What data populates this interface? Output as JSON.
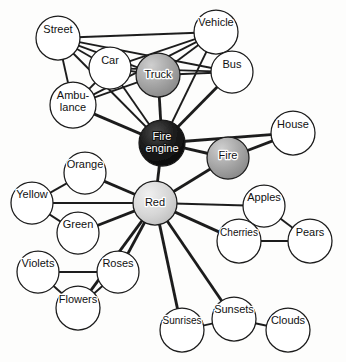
{
  "figure": {
    "caption": "",
    "width": 346,
    "height": 362,
    "background": "#fdfdfc"
  },
  "style": {
    "node_outline": "#1a1a1a",
    "link_color": "#1f1f1f",
    "label_color": "#111111",
    "label_color_on_dark": "#ffffff",
    "fill_empty": "#ffffff",
    "fill_light": "#d8d8d8",
    "fill_medium": "#9a9a9a",
    "fill_dark": "#141414"
  },
  "nodes": [
    {
      "id": "street",
      "label": "Street",
      "x": 58,
      "y": 38,
      "r": 22,
      "activation": "none",
      "label_dx": 0,
      "label_dy": -8,
      "lines": [
        "Street"
      ]
    },
    {
      "id": "vehicle",
      "label": "Vehicle",
      "x": 216,
      "y": 32,
      "r": 22,
      "activation": "none",
      "label_dx": 0,
      "label_dy": -9,
      "lines": [
        "Vehicle"
      ]
    },
    {
      "id": "car",
      "label": "Car",
      "x": 110,
      "y": 68,
      "r": 21,
      "activation": "none",
      "label_dx": 0,
      "label_dy": -7,
      "lines": [
        "Car"
      ]
    },
    {
      "id": "truck",
      "label": "Truck",
      "x": 158,
      "y": 75,
      "r": 22,
      "activation": "medium",
      "label_dx": 0,
      "label_dy": 0,
      "lines": [
        "Truck"
      ]
    },
    {
      "id": "bus",
      "label": "Bus",
      "x": 232,
      "y": 72,
      "r": 21,
      "activation": "none",
      "label_dx": 0,
      "label_dy": -7,
      "lines": [
        "Bus"
      ]
    },
    {
      "id": "ambulance",
      "label": "Ambulance",
      "x": 73,
      "y": 105,
      "r": 23,
      "activation": "none",
      "label_dx": 0,
      "label_dy": -3,
      "lines": [
        "Ambu-",
        "lance"
      ]
    },
    {
      "id": "fireengine",
      "label": "Fire engine",
      "x": 162,
      "y": 143,
      "r": 23,
      "activation": "dark",
      "label_dx": 0,
      "label_dy": 0,
      "lines": [
        "Fire",
        "engine"
      ]
    },
    {
      "id": "fire",
      "label": "Fire",
      "x": 228,
      "y": 158,
      "r": 21,
      "activation": "medium",
      "label_dx": 0,
      "label_dy": -2,
      "lines": [
        "Fire"
      ]
    },
    {
      "id": "house",
      "label": "House",
      "x": 293,
      "y": 133,
      "r": 22,
      "activation": "none",
      "label_dx": 0,
      "label_dy": -8,
      "lines": [
        "House"
      ]
    },
    {
      "id": "orange",
      "label": "Orange",
      "x": 85,
      "y": 173,
      "r": 21,
      "activation": "none",
      "label_dx": 0,
      "label_dy": -8,
      "lines": [
        "Orange"
      ]
    },
    {
      "id": "red",
      "label": "Red",
      "x": 155,
      "y": 203,
      "r": 22,
      "activation": "light",
      "label_dx": 0,
      "label_dy": 0,
      "lines": [
        "Red"
      ]
    },
    {
      "id": "yellow",
      "label": "Yellow",
      "x": 32,
      "y": 203,
      "r": 21,
      "activation": "none",
      "label_dx": 0,
      "label_dy": -8,
      "lines": [
        "Yellow"
      ]
    },
    {
      "id": "green",
      "label": "Green",
      "x": 78,
      "y": 233,
      "r": 21,
      "activation": "none",
      "label_dx": 0,
      "label_dy": -8,
      "lines": [
        "Green"
      ]
    },
    {
      "id": "apples",
      "label": "Apples",
      "x": 264,
      "y": 206,
      "r": 21,
      "activation": "none",
      "label_dx": 0,
      "label_dy": -8,
      "lines": [
        "Apples"
      ]
    },
    {
      "id": "cherries",
      "label": "Cherries",
      "x": 239,
      "y": 241,
      "r": 22,
      "activation": "none",
      "label_dx": 0,
      "label_dy": -8,
      "lines": [
        "Cherries"
      ]
    },
    {
      "id": "pears",
      "label": "Pears",
      "x": 310,
      "y": 241,
      "r": 22,
      "activation": "none",
      "label_dx": 0,
      "label_dy": -8,
      "lines": [
        "Pears"
      ]
    },
    {
      "id": "violets",
      "label": "Violets",
      "x": 38,
      "y": 272,
      "r": 21,
      "activation": "none",
      "label_dx": 0,
      "label_dy": -8,
      "lines": [
        "Violets"
      ]
    },
    {
      "id": "roses",
      "label": "Roses",
      "x": 118,
      "y": 272,
      "r": 21,
      "activation": "none",
      "label_dx": 0,
      "label_dy": -8,
      "lines": [
        "Roses"
      ]
    },
    {
      "id": "flowers",
      "label": "Flowers",
      "x": 78,
      "y": 308,
      "r": 22,
      "activation": "none",
      "label_dx": 0,
      "label_dy": -8,
      "lines": [
        "Flowers"
      ]
    },
    {
      "id": "sunrises",
      "label": "Sunrises",
      "x": 182,
      "y": 330,
      "r": 22,
      "activation": "none",
      "label_dx": 0,
      "label_dy": -9,
      "lines": [
        "Sunrises"
      ]
    },
    {
      "id": "sunsets",
      "label": "Sunsets",
      "x": 234,
      "y": 319,
      "r": 22,
      "activation": "none",
      "label_dx": 0,
      "label_dy": -9,
      "lines": [
        "Sunsets"
      ]
    },
    {
      "id": "clouds",
      "label": "Clouds",
      "x": 288,
      "y": 330,
      "r": 22,
      "activation": "none",
      "label_dx": 0,
      "label_dy": -9,
      "lines": [
        "Clouds"
      ]
    }
  ],
  "links": [
    {
      "from": "street",
      "to": "vehicle",
      "weight": 2
    },
    {
      "from": "street",
      "to": "car",
      "weight": 2
    },
    {
      "from": "street",
      "to": "truck",
      "weight": 2
    },
    {
      "from": "street",
      "to": "bus",
      "weight": 2
    },
    {
      "from": "street",
      "to": "ambulance",
      "weight": 2
    },
    {
      "from": "street",
      "to": "fireengine",
      "weight": 2
    },
    {
      "from": "vehicle",
      "to": "car",
      "weight": 2
    },
    {
      "from": "vehicle",
      "to": "truck",
      "weight": 2
    },
    {
      "from": "vehicle",
      "to": "bus",
      "weight": 2
    },
    {
      "from": "vehicle",
      "to": "ambulance",
      "weight": 2
    },
    {
      "from": "vehicle",
      "to": "fireengine",
      "weight": 2
    },
    {
      "from": "car",
      "to": "truck",
      "weight": 2
    },
    {
      "from": "car",
      "to": "bus",
      "weight": 2
    },
    {
      "from": "car",
      "to": "ambulance",
      "weight": 2
    },
    {
      "from": "car",
      "to": "fireengine",
      "weight": 2
    },
    {
      "from": "truck",
      "to": "bus",
      "weight": 2
    },
    {
      "from": "truck",
      "to": "fireengine",
      "weight": 3
    },
    {
      "from": "bus",
      "to": "fireengine",
      "weight": 3
    },
    {
      "from": "ambulance",
      "to": "fireengine",
      "weight": 3
    },
    {
      "from": "ambulance",
      "to": "truck",
      "weight": 2
    },
    {
      "from": "fireengine",
      "to": "fire",
      "weight": 3
    },
    {
      "from": "fireengine",
      "to": "house",
      "weight": 3
    },
    {
      "from": "fireengine",
      "to": "red",
      "weight": 3
    },
    {
      "from": "fire",
      "to": "house",
      "weight": 3
    },
    {
      "from": "fire",
      "to": "red",
      "weight": 3
    },
    {
      "from": "red",
      "to": "orange",
      "weight": 3
    },
    {
      "from": "red",
      "to": "yellow",
      "weight": 2
    },
    {
      "from": "red",
      "to": "green",
      "weight": 3
    },
    {
      "from": "red",
      "to": "roses",
      "weight": 3
    },
    {
      "from": "red",
      "to": "flowers",
      "weight": 3
    },
    {
      "from": "red",
      "to": "sunrises",
      "weight": 3
    },
    {
      "from": "red",
      "to": "sunsets",
      "weight": 3
    },
    {
      "from": "red",
      "to": "apples",
      "weight": 2
    },
    {
      "from": "red",
      "to": "cherries",
      "weight": 3
    },
    {
      "from": "orange",
      "to": "yellow",
      "weight": 2
    },
    {
      "from": "yellow",
      "to": "green",
      "weight": 2
    },
    {
      "from": "violets",
      "to": "roses",
      "weight": 2
    },
    {
      "from": "violets",
      "to": "flowers",
      "weight": 2
    },
    {
      "from": "roses",
      "to": "flowers",
      "weight": 2
    },
    {
      "from": "apples",
      "to": "cherries",
      "weight": 2
    },
    {
      "from": "apples",
      "to": "pears",
      "weight": 2
    },
    {
      "from": "cherries",
      "to": "pears",
      "weight": 2
    },
    {
      "from": "sunrises",
      "to": "sunsets",
      "weight": 2
    },
    {
      "from": "sunsets",
      "to": "clouds",
      "weight": 2
    }
  ]
}
